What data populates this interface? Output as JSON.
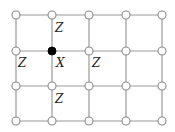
{
  "diagram": {
    "type": "grid-lattice",
    "columns_x": [
      16,
      52,
      89,
      126,
      162
    ],
    "rows_y": [
      15,
      51,
      86,
      121
    ],
    "node_radius": 4,
    "filled_node": {
      "col": 1,
      "row": 1,
      "label": "X"
    },
    "labels": [
      {
        "text": "Z",
        "x": 55,
        "y": 28
      },
      {
        "text": "Z",
        "x": 18,
        "y": 63
      },
      {
        "text": "X",
        "x": 56,
        "y": 63
      },
      {
        "text": "Z",
        "x": 92,
        "y": 63
      },
      {
        "text": "Z",
        "x": 55,
        "y": 99
      }
    ],
    "colors": {
      "edge": "#9a9a9a",
      "node_fill": "#ffffff",
      "filled": "#000000"
    }
  }
}
